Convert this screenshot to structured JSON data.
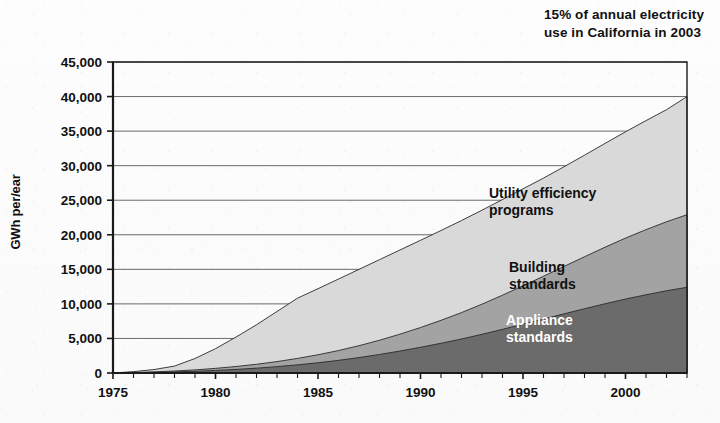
{
  "annotation": {
    "text": "15% of annual electricity\nuse in California in 2003"
  },
  "axes": {
    "ylabel": "GWh per/ear",
    "ytick_labels": [
      "45,000",
      "40,000",
      "35,000",
      "30,000",
      "25,000",
      "20,000",
      "15,000",
      "10,000",
      "5,000",
      "0"
    ],
    "xtick_labels": [
      "1975",
      "1980",
      "1985",
      "1990",
      "1995",
      "2000"
    ]
  },
  "series_labels": {
    "utility": "Utility efficiency\nprograms",
    "building": "Building\nstandards",
    "appliance": "Appliance\nstandards"
  },
  "colors": {
    "utility": "#d9d9d9",
    "building": "#a3a3a3",
    "appliance": "#6b6b6b",
    "axis": "#1a1a1a",
    "grid": "#5a5a5a"
  },
  "chart_data": {
    "type": "area",
    "title": "",
    "subtitle": "",
    "xlabel": "",
    "ylabel": "GWh per year",
    "xlim": [
      1975,
      2003
    ],
    "ylim": [
      0,
      45000
    ],
    "grid": true,
    "stacked": true,
    "legend_position": "inline-annotations",
    "annotations": [
      {
        "text": "15% of annual electricity use in California in 2003",
        "target": "top of stack in 2003 (~40,000 GWh)"
      }
    ],
    "x": [
      1975,
      1976,
      1977,
      1978,
      1979,
      1980,
      1981,
      1982,
      1983,
      1984,
      1985,
      1986,
      1987,
      1988,
      1989,
      1990,
      1991,
      1992,
      1993,
      1994,
      1995,
      1996,
      1997,
      1998,
      1999,
      2000,
      2001,
      2002,
      2003
    ],
    "yticks": [
      0,
      5000,
      10000,
      15000,
      20000,
      25000,
      30000,
      35000,
      40000,
      45000
    ],
    "xticks": [
      1975,
      1980,
      1985,
      1990,
      1995,
      2000
    ],
    "series": [
      {
        "name": "Appliance standards",
        "color": "#6b6b6b",
        "values": [
          0,
          40,
          90,
          160,
          250,
          370,
          520,
          700,
          920,
          1180,
          1480,
          1830,
          2230,
          2680,
          3180,
          3720,
          4300,
          4920,
          5600,
          6320,
          7060,
          7800,
          8560,
          9300,
          10020,
          10700,
          11320,
          11900,
          12400
        ]
      },
      {
        "name": "Building standards",
        "color": "#a3a3a3",
        "values": [
          0,
          30,
          70,
          130,
          200,
          300,
          420,
          560,
          730,
          930,
          1160,
          1420,
          1720,
          2060,
          2440,
          2860,
          3320,
          3820,
          4360,
          4940,
          5560,
          6200,
          6860,
          7520,
          8180,
          8820,
          9420,
          9980,
          10500
        ]
      },
      {
        "name": "Utility efficiency programs",
        "color": "#d9d9d9",
        "values": [
          0,
          130,
          340,
          710,
          1650,
          2850,
          4260,
          5720,
          7250,
          8720,
          9560,
          10350,
          11050,
          11660,
          12180,
          12620,
          13000,
          13320,
          13600,
          13840,
          14030,
          14200,
          14420,
          14700,
          15020,
          15380,
          15780,
          16220,
          17100
        ]
      }
    ],
    "totals": [
      0,
      200,
      500,
      1000,
      2100,
      3520,
      5200,
      6980,
      8900,
      10830,
      12200,
      13600,
      15000,
      16400,
      17800,
      19200,
      20620,
      22060,
      23560,
      25100,
      26650,
      28200,
      29840,
      31520,
      33220,
      34900,
      36520,
      38100,
      40000
    ]
  }
}
